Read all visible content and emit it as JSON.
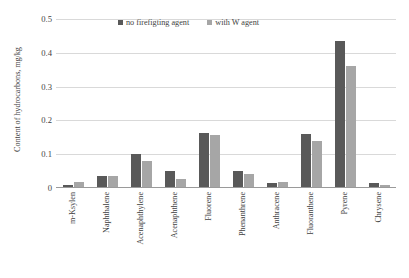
{
  "chart_data": {
    "type": "bar",
    "title": "",
    "xlabel": "",
    "ylabel": "Content of hydrocarbons, mg/kg",
    "ylim": [
      0,
      0.5
    ],
    "yticks": [
      "0",
      "0.1",
      "0.2",
      "0.3",
      "0.4",
      "0.5"
    ],
    "ytick_values": [
      0,
      0.1,
      0.2,
      0.3,
      0.4,
      0.5
    ],
    "grid": true,
    "legend_position": "top-center",
    "categories": [
      "m-Ksylen",
      "Naphthalene",
      "Acenaphthylene",
      "Acenaphthene",
      "Fluorene",
      "Phenanthrene",
      "Anthracene",
      "Fluoranthene",
      "Pyrene",
      "Chrysene"
    ],
    "series": [
      {
        "name": "no firefigting agent",
        "color": "#595959",
        "values": [
          0.01,
          0.037,
          0.101,
          0.05,
          0.164,
          0.05,
          0.015,
          0.159,
          0.435,
          0.014
        ]
      },
      {
        "name": "with W agent",
        "color": "#a6a6a6",
        "values": [
          0.018,
          0.035,
          0.08,
          0.026,
          0.157,
          0.04,
          0.017,
          0.139,
          0.361,
          0.008
        ]
      }
    ]
  }
}
